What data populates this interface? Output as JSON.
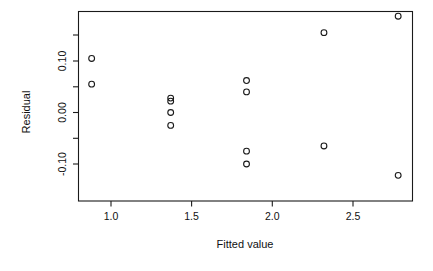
{
  "chart_data": {
    "type": "scatter",
    "title": "",
    "xlabel": "Fitted value",
    "ylabel": "Residual",
    "grid": false,
    "legend": null,
    "xlim": [
      0.79,
      2.88
    ],
    "ylim": [
      -0.145,
      0.205
    ],
    "xticks": [
      1.0,
      1.5,
      2.0,
      2.5
    ],
    "xticklabels": [
      "1.0",
      "1.5",
      "2.0",
      "2.5"
    ],
    "yticks": [
      -0.1,
      -0.05,
      0.0,
      0.05,
      0.1,
      0.15
    ],
    "yticklabels": [
      "-0.10",
      "",
      "0.00",
      "",
      "0.10",
      ""
    ],
    "marker": "open-circle",
    "marker_color": "#1a1a1a",
    "points": [
      {
        "x": 0.88,
        "y": 0.105
      },
      {
        "x": 0.88,
        "y": 0.055
      },
      {
        "x": 1.37,
        "y": 0.028
      },
      {
        "x": 1.37,
        "y": 0.022
      },
      {
        "x": 1.37,
        "y": 0.0
      },
      {
        "x": 1.37,
        "y": -0.025
      },
      {
        "x": 1.84,
        "y": 0.062
      },
      {
        "x": 1.84,
        "y": 0.04
      },
      {
        "x": 1.84,
        "y": -0.075
      },
      {
        "x": 1.84,
        "y": -0.1
      },
      {
        "x": 2.32,
        "y": 0.155
      },
      {
        "x": 2.32,
        "y": -0.065
      },
      {
        "x": 2.78,
        "y": 0.187
      },
      {
        "x": 2.78,
        "y": -0.122
      }
    ],
    "x": [
      0.88,
      0.88,
      1.37,
      1.37,
      1.37,
      1.37,
      1.84,
      1.84,
      1.84,
      1.84,
      2.32,
      2.32,
      2.78,
      2.78
    ],
    "values": [
      0.105,
      0.055,
      0.028,
      0.022,
      0.0,
      -0.025,
      0.062,
      0.04,
      -0.075,
      -0.1,
      0.155,
      -0.065,
      0.187,
      -0.122
    ]
  },
  "axes": {
    "x_title": "Fitted value",
    "y_title": "Residual",
    "x_tick_labels": [
      "1.0",
      "1.5",
      "2.0",
      "2.5"
    ],
    "y_tick_labels": [
      "0.10",
      "0.00",
      "-0.10"
    ]
  },
  "colors": {
    "foreground": "#1a1a1a",
    "background": "#ffffff"
  }
}
